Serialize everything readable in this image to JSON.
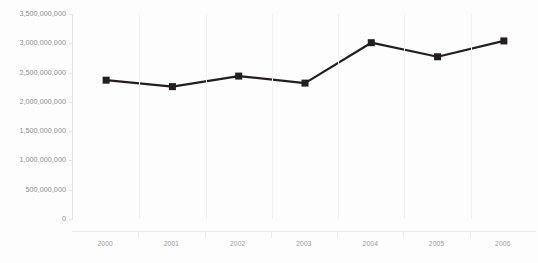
{
  "chart_data": {
    "type": "line",
    "title": "",
    "subtitle": "",
    "xlabel": "",
    "ylabel": "",
    "categories": [
      "2000",
      "2001",
      "2002",
      "2003",
      "2004",
      "2005",
      "2006"
    ],
    "values": [
      2370000000,
      2260000000,
      2440000000,
      2320000000,
      3010000000,
      2770000000,
      3040000000
    ],
    "series": [
      {
        "name": "",
        "values": [
          2370000000,
          2260000000,
          2440000000,
          2320000000,
          3010000000,
          2770000000,
          3040000000
        ]
      }
    ],
    "ylim": [
      0,
      3500000000
    ],
    "ytick_values": [
      0,
      500000000,
      1000000000,
      1500000000,
      2000000000,
      2500000000,
      3000000000,
      3500000000
    ],
    "ytick_labels": [
      "0",
      "500,000,000",
      "1,000,000,000",
      "1,500,000,000",
      "2,000,000,000",
      "2,500,000,000",
      "3,000,000,000",
      "3,500,000,000"
    ],
    "xtick_labels": [
      "2000",
      "2001",
      "2002",
      "2003",
      "2004",
      "2005",
      "2006"
    ],
    "grid": {
      "vertical": true,
      "horizontal": false
    },
    "legend": {
      "visible": false,
      "position": "none"
    },
    "marker": "square",
    "line_color": "#231f20",
    "marker_color": "#231f20",
    "gridline_color": "#f1f1f1",
    "axis_color": "#e4e4e4",
    "label_color": "#8d8d8d",
    "background_color": "#fdfdfd",
    "annotations": []
  }
}
